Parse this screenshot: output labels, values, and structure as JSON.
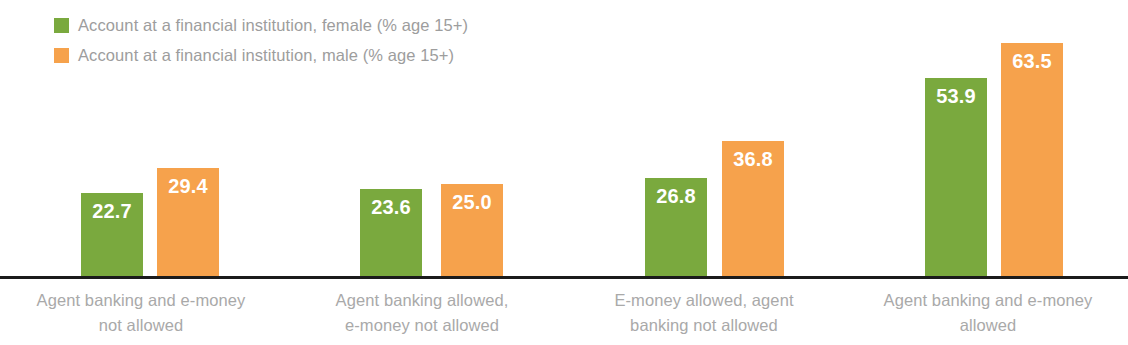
{
  "legend": {
    "position": "top-left",
    "items": [
      {
        "label": "Account at a financial institution, female (% age 15+)",
        "color": "#7aa93e",
        "swatch_name": "legend-swatch-female"
      },
      {
        "label": "Account at a financial institution, male (% age 15+)",
        "color": "#f6a24c",
        "swatch_name": "legend-swatch-male"
      }
    ]
  },
  "chart_data": {
    "type": "bar",
    "title": "",
    "subtitle": "",
    "xlabel": "",
    "ylabel": "",
    "ylim": [
      0,
      63.5
    ],
    "grid": false,
    "legend_position": "top-left",
    "categories": [
      "Agent banking and e-money not allowed",
      "Agent banking allowed, e-money not allowed",
      "E-money allowed, agent banking not allowed",
      "Agent banking and e-money allowed"
    ],
    "category_lines": [
      [
        "Agent banking and e-money",
        "not allowed"
      ],
      [
        "Agent banking allowed,",
        "e-money not allowed"
      ],
      [
        "E-money allowed, agent",
        "banking not allowed"
      ],
      [
        "Agent banking and e-money",
        "allowed"
      ]
    ],
    "series": [
      {
        "name": "Account at a financial institution, female (% age 15+)",
        "color": "#7aa93e",
        "values": [
          22.7,
          23.6,
          26.8,
          53.9
        ],
        "labels": [
          "22.7",
          "23.6",
          "26.8",
          "53.9"
        ]
      },
      {
        "name": "Account at a financial institution, male (% age 15+)",
        "color": "#f6a24c",
        "values": [
          29.4,
          25.0,
          36.8,
          63.5
        ],
        "labels": [
          "29.4",
          "25.0",
          "36.8",
          "63.5"
        ]
      }
    ]
  },
  "axis": {
    "baseline_color": "#1b1b1b"
  },
  "layout": {
    "bar_width": 62,
    "pixels_per_unit": 3.675,
    "baseline_y": 276,
    "group_x": [
      {
        "green": 81,
        "orange": 157,
        "label_center": 141
      },
      {
        "green": 360,
        "orange": 441,
        "label_center": 422
      },
      {
        "green": 645,
        "orange": 722,
        "label_center": 704
      },
      {
        "green": 925,
        "orange": 1001,
        "label_center": 988
      }
    ]
  }
}
